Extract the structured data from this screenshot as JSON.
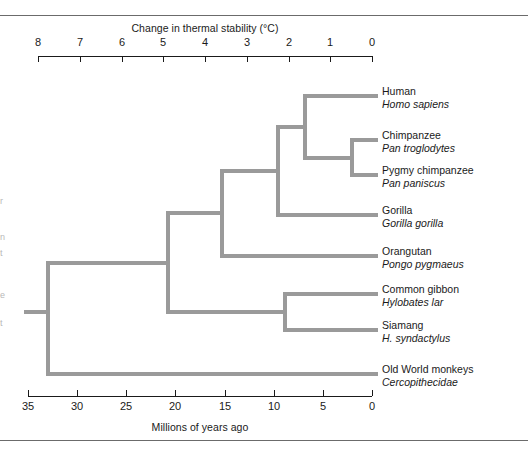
{
  "figure": {
    "top_axis": {
      "title": "Change in thermal stability (°C)",
      "ticks": [
        "8",
        "7",
        "6",
        "5",
        "4",
        "3",
        "2",
        "1",
        "0"
      ],
      "range": [
        8,
        0
      ],
      "pixel_left": 38,
      "pixel_right": 372
    },
    "bottom_axis": {
      "title": "Millions of years ago",
      "ticks": [
        "35",
        "30",
        "25",
        "20",
        "15",
        "10",
        "5",
        "0"
      ],
      "range": [
        35,
        0
      ],
      "pixel_left": 28,
      "pixel_right": 372
    },
    "colors": {
      "branch": "#9a9a9a",
      "axis": "#1a1a1a",
      "rule": "#6b6b6b",
      "text": "#1a1a1a"
    },
    "taxa": [
      {
        "common": "Human",
        "sci": "Homo sapiens",
        "tip_y": 96
      },
      {
        "common": "Chimpanzee",
        "sci": "Pan troglodytes",
        "tip_y": 140
      },
      {
        "common": "Pygmy chimpanzee",
        "sci": "Pan paniscus",
        "tip_y": 175
      },
      {
        "common": "Gorilla",
        "sci": "Gorilla gorilla",
        "tip_y": 215
      },
      {
        "common": "Orangutan",
        "sci": "Pongo pygmaeus",
        "tip_y": 256
      },
      {
        "common": "Common gibbon",
        "sci": "Hylobates lar",
        "tip_y": 294
      },
      {
        "common": "Siamang",
        "sci": "H. syndactylus",
        "tip_y": 330
      },
      {
        "common": "Old World monkeys",
        "sci": "Cercopithecidae",
        "tip_y": 374
      }
    ],
    "nodes": [
      {
        "name": "chimp-pygmy",
        "x": 352,
        "child_top_y": 140,
        "child_bottom_y": 175
      },
      {
        "name": "human-chimp-clade",
        "x": 305,
        "child_top_y": 96,
        "child_bottom_y": 157
      },
      {
        "name": "african-ape-clade",
        "x": 278,
        "child_top_y": 126,
        "child_bottom_y": 215
      },
      {
        "name": "great-ape-clade",
        "x": 222,
        "child_top_y": 170,
        "child_bottom_y": 256
      },
      {
        "name": "gibbon-siamang",
        "x": 285,
        "child_top_y": 294,
        "child_bottom_y": 330
      },
      {
        "name": "hominoid-clade",
        "x": 168,
        "child_top_y": 213,
        "child_bottom_y": 312
      },
      {
        "name": "catarrhine-root",
        "x": 48,
        "child_top_y": 262,
        "child_bottom_y": 374
      }
    ],
    "root_stub": {
      "x_start": 24,
      "x_end": 48,
      "y": 312
    },
    "tip_x": 378,
    "edge_fragments": [
      "r",
      "n",
      "t",
      "e",
      "t"
    ]
  }
}
